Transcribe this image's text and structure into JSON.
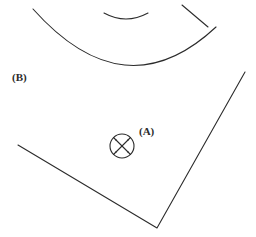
{
  "figure": {
    "width": 256,
    "height": 237,
    "background_color": "#ffffff",
    "stroke_color": "#2b2b2b",
    "stroke_width": 1.1
  },
  "labels": [
    {
      "id": "label-b",
      "text": "(B)",
      "x": 12,
      "y": 72,
      "refers_to": "large-arc"
    },
    {
      "id": "label-a",
      "text": "(A)",
      "x": 139,
      "y": 126,
      "refers_to": "monument-symbol"
    }
  ],
  "geometry": {
    "large_arc": {
      "name": "large-arc",
      "type": "arc",
      "start": [
        33,
        9
      ],
      "control": [
        125,
        112
      ],
      "end": [
        216,
        27
      ],
      "note": "broad downward-bulging curve across the upper half"
    },
    "small_arc": {
      "name": "small-arc",
      "type": "arc",
      "start": [
        104,
        13
      ],
      "control": [
        126,
        25
      ],
      "end": [
        148,
        13
      ],
      "note": "short shallow curve near the top centre"
    },
    "branch_line": {
      "name": "branch-line",
      "type": "line",
      "start": [
        182,
        5
      ],
      "end": [
        208,
        27
      ],
      "note": "short straight segment meeting the large arc on the right"
    },
    "polygon_corner": {
      "name": "polygon-corner",
      "type": "polyline",
      "points": [
        [
          18,
          145
        ],
        [
          157,
          228
        ],
        [
          245,
          72
        ]
      ],
      "note": "two long straight edges forming a lower vertex"
    },
    "monument_symbol": {
      "name": "monument-symbol",
      "type": "circle-with-cross-and-ticks",
      "center": [
        122,
        146
      ],
      "radius": 12,
      "cross_half_length": 6.5,
      "tick_inner_radius": 11,
      "tick_outer_radius": 17,
      "tick_angles_deg": [
        45,
        135,
        225,
        315
      ],
      "note": "circle containing an X with four radial ticks at the diagonals"
    }
  }
}
